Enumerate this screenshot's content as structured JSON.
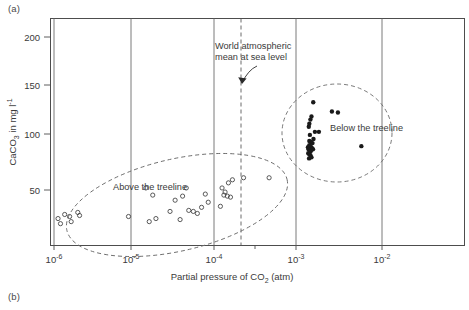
{
  "figure": {
    "panel_a_label": "(a)",
    "panel_b_label": "(b)"
  },
  "chart_data": {
    "type": "scatter",
    "title": "",
    "xlabel": "Partial pressure of CO2 (atm)",
    "xlabel_parts": {
      "pre": "Partial pressure of CO",
      "sub": "2",
      "post": " (atm)"
    },
    "ylabel": "CaCO3 in mg l-1",
    "ylabel_parts": {
      "pre": "CaCO",
      "sub": "3",
      "mid": " in mg l",
      "sup": "-1"
    },
    "xscale": "log",
    "xlim": [
      1e-06,
      0.031
    ],
    "ylim": [
      10,
      215
    ],
    "xtick_labels": [
      "10-6",
      "10-5",
      "10-4",
      "10-3",
      "10-2"
    ],
    "xtick_exponents": [
      "-6",
      "-5",
      "-4",
      "-3",
      "-2"
    ],
    "xtick_mantissa": "10",
    "xticks": [
      1e-06,
      1e-05,
      0.0001,
      0.001,
      0.01
    ],
    "ytick_labels": [
      "50",
      "100",
      "150",
      "200"
    ],
    "yticks": [
      50,
      100,
      150,
      200
    ],
    "grid": "vertical-at-decades",
    "legend_position": "inline-annotations",
    "annotations": [
      {
        "name": "world-atmospheric-mean",
        "line1": "World atmospheric",
        "line2": "mean at sea level",
        "marker_x": 0.0002,
        "marker_style": "vertical dashed line with arrow"
      },
      {
        "name": "above-treeline-label",
        "text": "Above the treeline"
      },
      {
        "name": "below-treeline-label",
        "text": "Below the treeline"
      }
    ],
    "series": [
      {
        "name": "Above the treeline",
        "marker": "open-circle",
        "color": "#3d3d3d",
        "points": [
          [
            1.12e-06,
            22
          ],
          [
            1.2e-06,
            17
          ],
          [
            1.35e-06,
            26
          ],
          [
            1.55e-06,
            24
          ],
          [
            1.62e-06,
            19
          ],
          [
            1.95e-06,
            28
          ],
          [
            2.05e-06,
            25
          ],
          [
            8.1e-06,
            24
          ],
          [
            1.32e-05,
            52
          ],
          [
            1.45e-05,
            19
          ],
          [
            1.6e-05,
            45
          ],
          [
            1.75e-05,
            22
          ],
          [
            2.6e-05,
            29
          ],
          [
            3e-05,
            40
          ],
          [
            3.45e-05,
            21
          ],
          [
            3.7e-05,
            44
          ],
          [
            4.1e-05,
            52
          ],
          [
            4.4e-05,
            30
          ],
          [
            5e-05,
            29
          ],
          [
            5.6e-05,
            27
          ],
          [
            6.3e-05,
            33
          ],
          [
            7e-05,
            46
          ],
          [
            7.6e-05,
            38
          ],
          [
            0.000107,
            34
          ],
          [
            0.000112,
            52
          ],
          [
            0.000118,
            45
          ],
          [
            0.000122,
            48
          ],
          [
            0.00013,
            44
          ],
          [
            0.000134,
            57
          ],
          [
            0.000142,
            43
          ],
          [
            0.00015,
            60
          ],
          [
            0.000205,
            62
          ],
          [
            0.00042,
            62
          ]
        ]
      },
      {
        "name": "Below the treeline",
        "marker": "filled-circle",
        "color": "#1a1a1a",
        "points": [
          [
            0.00145,
            136
          ],
          [
            0.00138,
            122
          ],
          [
            0.00134,
            119
          ],
          [
            0.0013,
            115
          ],
          [
            0.00128,
            112
          ],
          [
            0.00152,
            107
          ],
          [
            0.0017,
            107
          ],
          [
            0.00245,
            127
          ],
          [
            0.0029,
            126
          ],
          [
            0.00132,
            104
          ],
          [
            0.0013,
            98
          ],
          [
            0.00136,
            97
          ],
          [
            0.00142,
            96
          ],
          [
            0.00146,
            100
          ],
          [
            0.0013,
            94
          ],
          [
            0.00133,
            93
          ],
          [
            0.00137,
            92
          ],
          [
            0.0014,
            91
          ],
          [
            0.00125,
            92
          ],
          [
            0.00127,
            90
          ],
          [
            0.00131,
            89
          ],
          [
            0.00135,
            88
          ],
          [
            0.00144,
            90
          ],
          [
            0.00126,
            86
          ],
          [
            0.0013,
            85
          ],
          [
            0.00134,
            84
          ],
          [
            0.00129,
            81
          ],
          [
            0.00138,
            82
          ],
          [
            0.0056,
            93
          ]
        ]
      }
    ],
    "envelopes": [
      {
        "name": "above-treeline-envelope",
        "style": "dashed-ellipse",
        "group": "Above the treeline"
      },
      {
        "name": "below-treeline-envelope",
        "style": "dashed-ellipse",
        "group": "Below the treeline"
      }
    ]
  }
}
